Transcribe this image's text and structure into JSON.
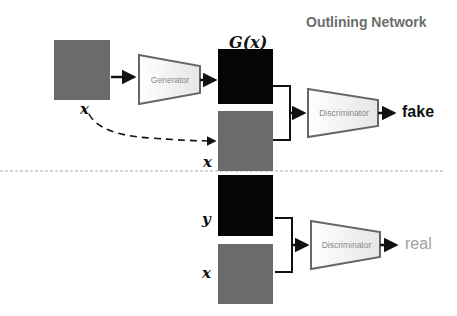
{
  "title": "Outlining Network",
  "labels": {
    "x_input": "x",
    "g_of_x": "G(x)",
    "x_pair_fake": "x",
    "y_real": "y",
    "x_pair_real": "x"
  },
  "blocks": {
    "generator": "Generator",
    "discriminator_top": "Discriminator",
    "discriminator_bottom": "Discriminator"
  },
  "outputs": {
    "fake": "fake",
    "real": "real"
  },
  "colors": {
    "fake": "#111111",
    "real": "#a0a0a0",
    "title": "#6d6d6d",
    "separator": "#aaaaaa"
  }
}
